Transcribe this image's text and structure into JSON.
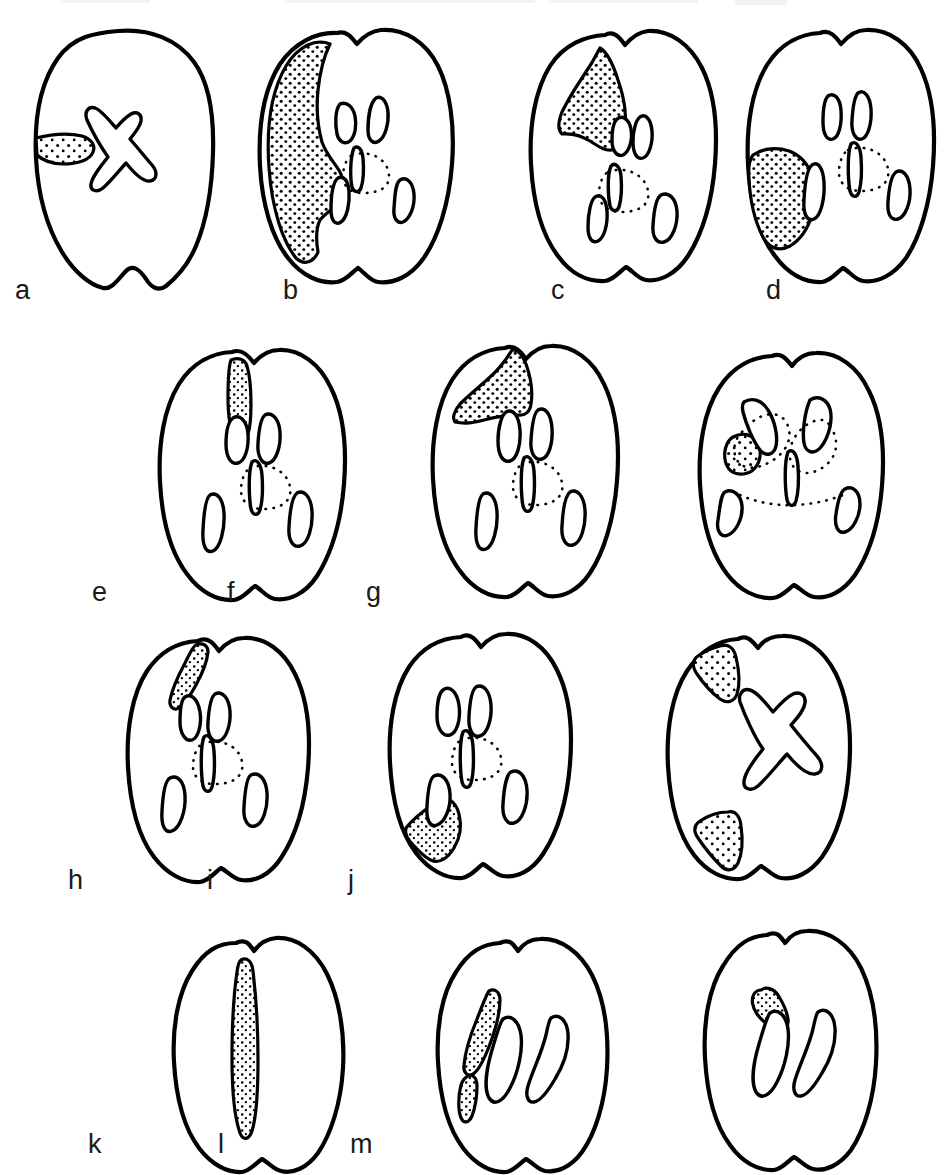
{
  "figure": {
    "type": "anatomical-diagram",
    "background_color": "#ffffff",
    "line_color": "#000000",
    "stipple_color": "#000000",
    "panel_count": 13,
    "rows": 4,
    "labels": [
      "a",
      "b",
      "c",
      "d",
      "e",
      "f",
      "g",
      "h",
      "i",
      "j",
      "k",
      "l",
      "m"
    ]
  },
  "panels": [
    {
      "label": "a",
      "row": 1,
      "ventricle_shape": "x-shaped",
      "lesion_count": 1,
      "lesion_location": "left lateral mid",
      "lesion_description": "small horizontal tongue-shaped stippled area on left lateral margin",
      "label_x": 15,
      "label_y": 299
    },
    {
      "label": "b",
      "row": 1,
      "ventricle_shape": "slit-and-horns",
      "lesion_count": 1,
      "lesion_location": "left hemisphere, large",
      "lesion_description": "large stippled area covering nearly the whole left hemisphere from frontal to occipital",
      "label_x": 283,
      "label_y": 299
    },
    {
      "label": "c",
      "row": 1,
      "ventricle_shape": "slit-and-horns",
      "lesion_count": 1,
      "lesion_location": "left frontal",
      "lesion_description": "wedge-shaped stippled area in left frontal region",
      "label_x": 551,
      "label_y": 299
    },
    {
      "label": "d",
      "row": 1,
      "ventricle_shape": "slit-and-horns",
      "lesion_count": 1,
      "lesion_location": "left lateral mid",
      "lesion_description": "rounded stippled area at left mid-lateral cortex",
      "label_x": 766,
      "label_y": 299
    },
    {
      "label": "e",
      "row": 2,
      "ventricle_shape": "slit-and-horns",
      "lesion_count": 1,
      "lesion_location": "left parasagittal frontal",
      "lesion_description": "narrow vertical stippled strip beside midline in frontal lobe",
      "label_x": 92,
      "label_y": 601
    },
    {
      "label": "f",
      "row": 2,
      "ventricle_shape": "slit-and-horns",
      "lesion_count": 1,
      "lesion_location": "left frontal, broad",
      "lesion_description": "broad stippled block in left frontal lobe reaching midline",
      "label_x": 227,
      "label_y": 601
    },
    {
      "label": "g",
      "row": 2,
      "ventricle_shape": "horns-and-slit-with-dotted-region",
      "lesion_count": 1,
      "lesion_location": "left basal ganglia",
      "lesion_description": "small round stippled nodule lateral to left frontal horn",
      "label_x": 366,
      "label_y": 601
    },
    {
      "label": "h",
      "row": 3,
      "ventricle_shape": "slit-and-horns",
      "lesion_count": 1,
      "lesion_location": "left superior frontal",
      "lesion_description": "narrow oblique stippled strip at left superior frontal margin",
      "label_x": 68,
      "label_y": 889
    },
    {
      "label": "i",
      "row": 3,
      "ventricle_shape": "slit-and-horns",
      "lesion_count": 1,
      "lesion_location": "left posterior inferior",
      "lesion_description": "wedge of stipple at left posterior-inferior margin below temporal horn",
      "label_x": 207,
      "label_y": 889
    },
    {
      "label": "j",
      "row": 3,
      "ventricle_shape": "x-shaped",
      "lesion_count": 2,
      "lesion_location": "left superior and left inferior",
      "lesion_description": "two triangular stippled wedges on the left margin, one superior and one inferior",
      "label_x": 348,
      "label_y": 889
    },
    {
      "label": "k",
      "row": 4,
      "ventricle_shape": "none",
      "lesion_count": 1,
      "lesion_location": "left parasagittal, full length",
      "lesion_description": "long narrow stippled band running parasagittally the full anterior-posterior length",
      "label_x": 88,
      "label_y": 1153
    },
    {
      "label": "l",
      "row": 4,
      "ventricle_shape": "two-curved-slits",
      "lesion_count": 2,
      "lesion_location": "left, two elongated",
      "lesion_description": "an elongated oblique stippled streak and a small stippled dash lateral to the left ventricle",
      "label_x": 218,
      "label_y": 1153
    },
    {
      "label": "m",
      "row": 4,
      "ventricle_shape": "two-curved-slits",
      "lesion_count": 1,
      "lesion_location": "left superior",
      "lesion_description": "small short stippled streak in left superior region",
      "label_x": 350,
      "label_y": 1153
    }
  ]
}
